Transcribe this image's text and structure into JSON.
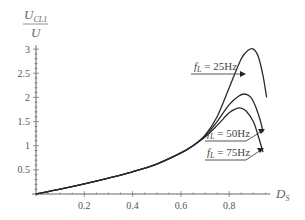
{
  "chart_data": {
    "type": "line",
    "title": "",
    "xlabel": "D_S",
    "ylabel": "U_CL1 / U",
    "xlim": [
      0,
      0.97
    ],
    "ylim": [
      0,
      3.1
    ],
    "grid": false,
    "legend": "inline annotations with arrows",
    "x_ticks": [
      "0.2",
      "0.4",
      "0.6",
      "0.8"
    ],
    "y_ticks": [
      "0.5",
      "1",
      "1.5",
      "2",
      "2.5",
      "3"
    ],
    "series": [
      {
        "name": "f_L = 25Hz",
        "x": [
          0.0,
          0.1,
          0.2,
          0.3,
          0.4,
          0.5,
          0.6,
          0.65,
          0.7,
          0.75,
          0.8,
          0.85,
          0.88,
          0.9,
          0.92,
          0.94,
          0.955
        ],
        "y": [
          0.0,
          0.1,
          0.21,
          0.33,
          0.46,
          0.62,
          0.85,
          1.0,
          1.22,
          1.6,
          2.2,
          2.8,
          2.98,
          3.0,
          2.85,
          2.45,
          2.0
        ]
      },
      {
        "name": "f_L = 50Hz",
        "x": [
          0.0,
          0.1,
          0.2,
          0.3,
          0.4,
          0.5,
          0.6,
          0.65,
          0.7,
          0.75,
          0.8,
          0.84,
          0.865,
          0.89,
          0.91,
          0.93,
          0.94
        ],
        "y": [
          0.0,
          0.1,
          0.21,
          0.33,
          0.46,
          0.62,
          0.85,
          1.0,
          1.2,
          1.5,
          1.85,
          2.03,
          2.07,
          2.0,
          1.8,
          1.5,
          1.28
        ]
      },
      {
        "name": "f_L = 75Hz",
        "x": [
          0.0,
          0.1,
          0.2,
          0.3,
          0.4,
          0.5,
          0.6,
          0.65,
          0.7,
          0.75,
          0.8,
          0.83,
          0.845,
          0.87,
          0.9,
          0.92,
          0.94
        ],
        "y": [
          0.0,
          0.1,
          0.21,
          0.33,
          0.46,
          0.62,
          0.85,
          1.0,
          1.18,
          1.42,
          1.68,
          1.77,
          1.78,
          1.72,
          1.5,
          1.2,
          0.87
        ]
      }
    ],
    "annotations": [
      "f_L = 25Hz",
      "f_L = 50Hz",
      "f_L = 75Hz"
    ]
  },
  "axes": {
    "y_label_main": "U",
    "y_label_sub": "CL1",
    "y_label_den": "U",
    "x_label_main": "D",
    "x_label_sub": "S"
  },
  "labels": {
    "f25": {
      "f": "f",
      "sub": "L",
      "rest": " = 25Hz"
    },
    "f50": {
      "f": "f",
      "sub": "L",
      "rest": " = 50Hz"
    },
    "f75": {
      "f": "f",
      "sub": "L",
      "rest": " = 75Hz"
    }
  },
  "colors": {
    "curve": "#2a2a2a",
    "axis": "#555555",
    "text": "#555555"
  }
}
